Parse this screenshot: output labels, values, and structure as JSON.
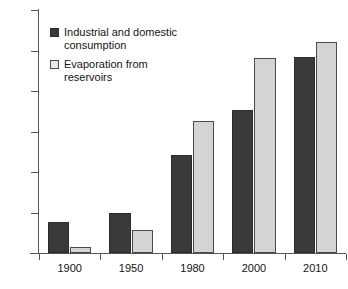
{
  "chart_data": {
    "type": "bar",
    "title": "",
    "xlabel": "",
    "ylabel": "",
    "categories": [
      "1900",
      "1950",
      "1980",
      "2000",
      "2010"
    ],
    "series": [
      {
        "name": "Industrial and domestic consumption",
        "color": "#3a3a3a",
        "values": [
          38,
          50,
          121,
          176,
          242
        ]
      },
      {
        "name": "Evaporation from reservoirs",
        "color": "#d4d4d4",
        "values": [
          8,
          28,
          163,
          241,
          261
        ]
      }
    ],
    "ylim": [
      0,
      300
    ],
    "yticks": [
      0,
      50,
      100,
      150,
      200,
      250,
      300
    ],
    "ytick_labels": [
      "0",
      "50",
      "100",
      "150",
      "200",
      "250",
      "300"
    ],
    "grid": false,
    "legend_position": "upper-left"
  },
  "legend": {
    "items": [
      {
        "label_line1": "Industrial and domestic",
        "label_line2": "consumption",
        "swatch": "dark"
      },
      {
        "label_line1": "Evaporation from",
        "label_line2": "reservoirs",
        "swatch": "light"
      }
    ]
  }
}
